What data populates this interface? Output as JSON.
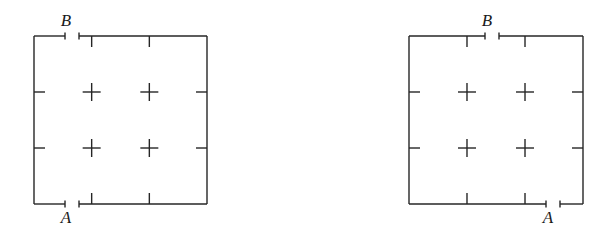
{
  "figure": {
    "title": "",
    "background_color": "#ffffff",
    "line_color": "#262626",
    "label_color": "#1a1a1a",
    "stroke_width": 1.4,
    "panels": [
      {
        "id": "left-square",
        "name": "left-square-panel",
        "square": {
          "x": 34,
          "y": 36,
          "width": 173,
          "height": 168
        },
        "tick_length": 11,
        "edge_ticks": {
          "top": [
            0.3333,
            0.6667
          ],
          "bottom": [
            0.3333,
            0.6667
          ],
          "left": [
            0.3333,
            0.6667
          ],
          "right": [
            0.3333,
            0.6667
          ]
        },
        "crosses": [
          {
            "fx": 0.3333,
            "fy": 0.3333
          },
          {
            "fx": 0.6667,
            "fy": 0.3333
          },
          {
            "fx": 0.3333,
            "fy": 0.6667
          },
          {
            "fx": 0.6667,
            "fy": 0.6667
          }
        ],
        "cross_size": 9,
        "gaps": [
          {
            "label": "B",
            "name": "gap-b",
            "edge": "top",
            "center_fraction": 0.2197,
            "half_width": 7,
            "label_dx": -6,
            "label_dy": -10
          },
          {
            "label": "A",
            "name": "gap-a",
            "edge": "bottom",
            "center_fraction": 0.2197,
            "half_width": 7,
            "label_dx": -6,
            "label_dy": 19
          }
        ]
      },
      {
        "id": "right-square",
        "name": "right-square-panel",
        "square": {
          "x": 409,
          "y": 36,
          "width": 174,
          "height": 168
        },
        "tick_length": 11,
        "edge_ticks": {
          "top": [
            0.3333,
            0.6667
          ],
          "bottom": [
            0.3333,
            0.6667
          ],
          "left": [
            0.3333,
            0.6667
          ],
          "right": [
            0.3333,
            0.6667
          ]
        },
        "crosses": [
          {
            "fx": 0.3333,
            "fy": 0.3333
          },
          {
            "fx": 0.6667,
            "fy": 0.3333
          },
          {
            "fx": 0.3333,
            "fy": 0.6667
          },
          {
            "fx": 0.6667,
            "fy": 0.6667
          }
        ],
        "cross_size": 9,
        "gaps": [
          {
            "label": "B",
            "name": "gap-b",
            "edge": "top",
            "center_fraction": 0.477,
            "half_width": 7,
            "label_dx": -5,
            "label_dy": -10
          },
          {
            "label": "A",
            "name": "gap-a",
            "edge": "bottom",
            "center_fraction": 0.8276,
            "half_width": 7,
            "label_dx": -5,
            "label_dy": 19
          }
        ]
      }
    ],
    "labels": {
      "a": "A",
      "b": "B"
    }
  }
}
